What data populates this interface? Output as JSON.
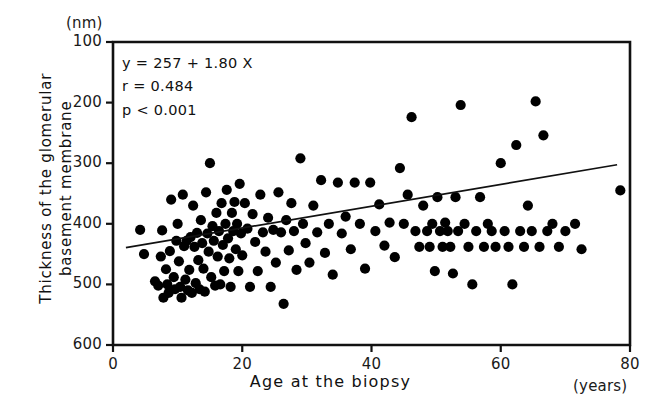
{
  "figure": {
    "background": "#ffffff",
    "ink_color": "#111111",
    "marker_color": "#000000"
  },
  "axes": {
    "y_unit_label": "(nm)",
    "x_unit_label": "(years)",
    "x_title": "Age at the biopsy",
    "y_title_line1": "Thickness of the glomerular",
    "y_title_line2": "basement membrane",
    "y_ticks": [
      "600",
      "500",
      "400",
      "300",
      "200",
      "100"
    ],
    "x_ticks": [
      "0",
      "20",
      "40",
      "60",
      "80"
    ]
  },
  "annotations": {
    "regression_equation": "y = 257 + 1.80 X",
    "correlation": "r = 0.484",
    "pvalue": "p < 0.001"
  },
  "chart_data": {
    "type": "scatter",
    "title": "",
    "xlabel": "Age at the biopsy",
    "ylabel": "Thickness of the glomerular basement membrane",
    "x_unit": "years",
    "y_unit": "nm",
    "xlim": [
      0,
      80
    ],
    "ylim": [
      100,
      600
    ],
    "xticks": [
      0,
      20,
      40,
      60,
      80
    ],
    "yticks": [
      100,
      200,
      300,
      400,
      500,
      600
    ],
    "grid": false,
    "legend": "none",
    "fit": {
      "type": "linear",
      "equation": "y = 257 + 1.80 X",
      "intercept": 257,
      "slope": 1.8,
      "r": 0.484,
      "p_text": "p < 0.001",
      "line_x_range": [
        2,
        78
      ]
    },
    "points": [
      [
        4.2,
        290
      ],
      [
        4.8,
        250
      ],
      [
        6.5,
        205
      ],
      [
        7.0,
        198
      ],
      [
        7.4,
        246
      ],
      [
        7.6,
        289
      ],
      [
        7.8,
        178
      ],
      [
        8.2,
        225
      ],
      [
        8.4,
        200
      ],
      [
        8.6,
        186
      ],
      [
        8.8,
        255
      ],
      [
        9.0,
        340
      ],
      [
        9.4,
        212
      ],
      [
        9.6,
        192
      ],
      [
        9.8,
        272
      ],
      [
        10.0,
        300
      ],
      [
        10.2,
        238
      ],
      [
        10.4,
        196
      ],
      [
        10.6,
        178
      ],
      [
        10.8,
        348
      ],
      [
        11.0,
        263
      ],
      [
        11.2,
        208
      ],
      [
        11.4,
        272
      ],
      [
        11.6,
        190
      ],
      [
        11.8,
        224
      ],
      [
        12.0,
        278
      ],
      [
        12.2,
        186
      ],
      [
        12.4,
        330
      ],
      [
        12.6,
        262
      ],
      [
        12.8,
        202
      ],
      [
        13.0,
        285
      ],
      [
        13.2,
        240
      ],
      [
        13.4,
        192
      ],
      [
        13.6,
        306
      ],
      [
        13.8,
        268
      ],
      [
        14.0,
        226
      ],
      [
        14.2,
        188
      ],
      [
        14.4,
        352
      ],
      [
        14.6,
        284
      ],
      [
        14.8,
        254
      ],
      [
        15.0,
        400
      ],
      [
        15.2,
        212
      ],
      [
        15.4,
        296
      ],
      [
        15.6,
        272
      ],
      [
        15.8,
        198
      ],
      [
        16.0,
        318
      ],
      [
        16.2,
        246
      ],
      [
        16.4,
        288
      ],
      [
        16.6,
        200
      ],
      [
        16.8,
        334
      ],
      [
        17.0,
        265
      ],
      [
        17.2,
        222
      ],
      [
        17.4,
        300
      ],
      [
        17.6,
        356
      ],
      [
        17.8,
        276
      ],
      [
        18.0,
        243
      ],
      [
        18.2,
        196
      ],
      [
        18.4,
        318
      ],
      [
        18.6,
        288
      ],
      [
        18.8,
        336
      ],
      [
        19.0,
        258
      ],
      [
        19.2,
        300
      ],
      [
        19.4,
        222
      ],
      [
        19.6,
        366
      ],
      [
        19.8,
        284
      ],
      [
        20.0,
        248
      ],
      [
        20.4,
        334
      ],
      [
        20.8,
        292
      ],
      [
        21.2,
        196
      ],
      [
        21.6,
        316
      ],
      [
        22.0,
        270
      ],
      [
        22.4,
        222
      ],
      [
        22.8,
        348
      ],
      [
        23.2,
        286
      ],
      [
        23.6,
        254
      ],
      [
        24.0,
        310
      ],
      [
        24.4,
        196
      ],
      [
        24.8,
        290
      ],
      [
        25.2,
        236
      ],
      [
        25.6,
        352
      ],
      [
        26.0,
        286
      ],
      [
        26.4,
        168
      ],
      [
        26.8,
        306
      ],
      [
        27.2,
        256
      ],
      [
        27.6,
        334
      ],
      [
        28.0,
        288
      ],
      [
        28.4,
        224
      ],
      [
        29.0,
        408
      ],
      [
        29.4,
        300
      ],
      [
        29.8,
        268
      ],
      [
        30.4,
        236
      ],
      [
        31.0,
        330
      ],
      [
        31.6,
        286
      ],
      [
        32.2,
        372
      ],
      [
        32.8,
        252
      ],
      [
        33.4,
        300
      ],
      [
        34.0,
        216
      ],
      [
        34.8,
        368
      ],
      [
        35.4,
        284
      ],
      [
        36.0,
        312
      ],
      [
        36.8,
        258
      ],
      [
        37.4,
        368
      ],
      [
        38.2,
        300
      ],
      [
        39.0,
        226
      ],
      [
        39.8,
        368
      ],
      [
        40.6,
        288
      ],
      [
        41.2,
        332
      ],
      [
        42.0,
        264
      ],
      [
        42.8,
        302
      ],
      [
        43.6,
        245
      ],
      [
        44.4,
        392
      ],
      [
        45.0,
        300
      ],
      [
        45.6,
        348
      ],
      [
        46.2,
        476
      ],
      [
        46.8,
        288
      ],
      [
        47.4,
        262
      ],
      [
        48.0,
        330
      ],
      [
        48.6,
        288
      ],
      [
        49.0,
        262
      ],
      [
        49.4,
        300
      ],
      [
        49.8,
        222
      ],
      [
        50.2,
        344
      ],
      [
        50.6,
        288
      ],
      [
        51.0,
        262
      ],
      [
        51.4,
        302
      ],
      [
        51.8,
        288
      ],
      [
        52.2,
        262
      ],
      [
        52.6,
        218
      ],
      [
        53.0,
        344
      ],
      [
        53.4,
        288
      ],
      [
        53.8,
        496
      ],
      [
        54.4,
        300
      ],
      [
        55.0,
        262
      ],
      [
        55.6,
        200
      ],
      [
        56.2,
        288
      ],
      [
        56.8,
        344
      ],
      [
        57.4,
        262
      ],
      [
        58.0,
        300
      ],
      [
        58.6,
        288
      ],
      [
        59.2,
        262
      ],
      [
        60.0,
        400
      ],
      [
        60.6,
        288
      ],
      [
        61.2,
        262
      ],
      [
        61.8,
        200
      ],
      [
        62.4,
        430
      ],
      [
        63.0,
        288
      ],
      [
        63.6,
        262
      ],
      [
        64.2,
        330
      ],
      [
        64.8,
        288
      ],
      [
        65.4,
        502
      ],
      [
        66.0,
        262
      ],
      [
        66.6,
        446
      ],
      [
        67.2,
        288
      ],
      [
        68.0,
        300
      ],
      [
        69.0,
        262
      ],
      [
        70.0,
        288
      ],
      [
        71.5,
        300
      ],
      [
        72.5,
        258
      ],
      [
        78.5,
        355
      ]
    ]
  }
}
